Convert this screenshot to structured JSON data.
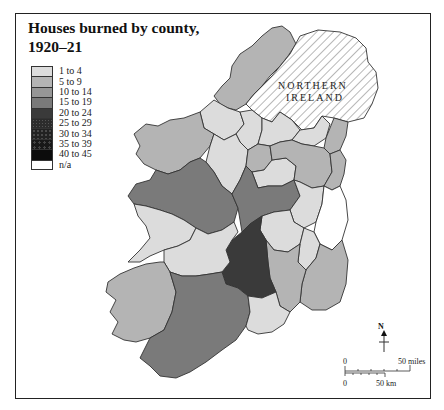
{
  "title": "Houses burned by county, 1920–21",
  "title_line1": "Houses burned by county,",
  "title_line2": "1920–21",
  "legend": {
    "items": [
      {
        "label": "1 to 4",
        "color": "#dcdcdc"
      },
      {
        "label": "5 to 9",
        "color": "#b4b4b4"
      },
      {
        "label": "10 to 14",
        "color": "#969696"
      },
      {
        "label": "15 to 19",
        "color": "#7a7a7a"
      },
      {
        "label": "20 to 24",
        "color": "#3a3a3a"
      },
      {
        "label": "25 to 29",
        "color": "#2c2c2c"
      },
      {
        "label": "30 to 34",
        "color": "#222222"
      },
      {
        "label": "35 to 39",
        "color": "#181818"
      },
      {
        "label": "40 to 45",
        "color": "#0c0c0c"
      },
      {
        "label": "n/a",
        "color": "#ffffff"
      }
    ]
  },
  "map": {
    "northern_ireland_label_1": "NORTHERN",
    "northern_ireland_label_2": "IRELAND",
    "colors": {
      "c1to4": "#dcdcdc",
      "c5to9": "#b4b4b4",
      "c10to14": "#969696",
      "c15to19": "#7a7a7a",
      "c20to24": "#3a3a3a",
      "na": "#ffffff",
      "border": "#333333",
      "hatch": "#9a9a9a"
    }
  },
  "compass": {
    "label": "N"
  },
  "scale": {
    "miles_zero": "0",
    "miles_label": "50 miles",
    "km_zero": "0",
    "km_label": "50 km"
  }
}
